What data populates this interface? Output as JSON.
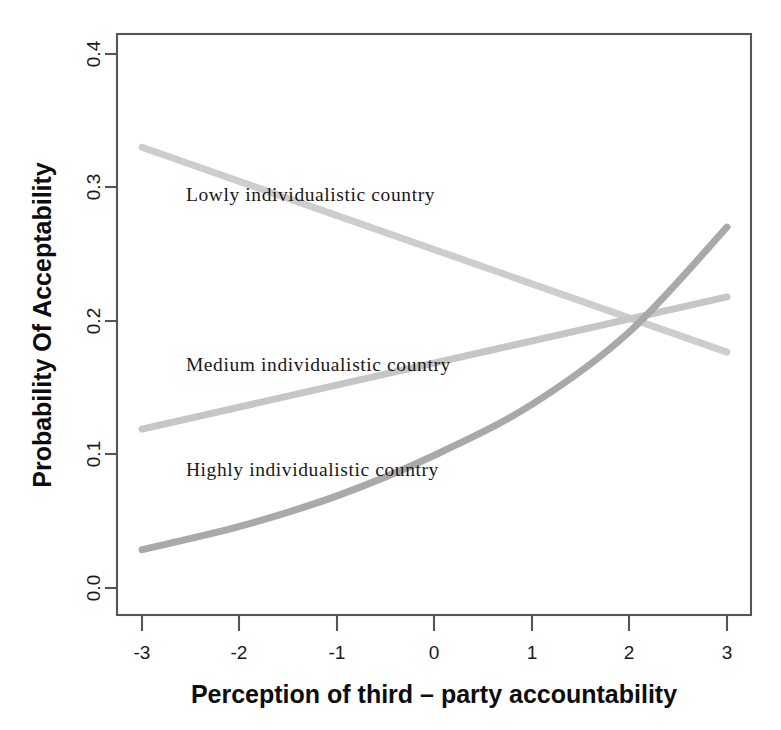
{
  "chart_data": {
    "type": "line",
    "title": "",
    "xlabel": "Perception of third – party accountability",
    "ylabel": "Probability Of Acceptability",
    "xlim": [
      -3,
      3
    ],
    "ylim": [
      0.0,
      0.4
    ],
    "grid": false,
    "legend_position": "inline-annotations",
    "x_ticks": [
      "-3",
      "-2",
      "-1",
      "0",
      "1",
      "2",
      "3"
    ],
    "x_tick_values": [
      -3,
      -2,
      -1,
      0,
      1,
      2,
      3
    ],
    "y_ticks": [
      "0.0",
      "0.1",
      "0.2",
      "0.3",
      "0.4"
    ],
    "y_tick_values": [
      0.0,
      0.1,
      0.2,
      0.3,
      0.4
    ],
    "x": [
      -3,
      -2,
      -1,
      0,
      1,
      2,
      3
    ],
    "series": [
      {
        "name": "Lowly individualistic country",
        "color": "#cdcdcd",
        "shape": "straight",
        "width": 7,
        "values": [
          0.322,
          0.299,
          0.275,
          0.251,
          0.228,
          0.204,
          0.181
        ]
      },
      {
        "name": "Medium individualistic country",
        "color": "#c6c6c6",
        "shape": "straight",
        "width": 7,
        "values": [
          0.128,
          0.143,
          0.158,
          0.173,
          0.189,
          0.204,
          0.219
        ]
      },
      {
        "name": "Highly individualistic country",
        "color": "#a9a9a9",
        "shape": "curved",
        "width": 7,
        "values": [
          0.045,
          0.061,
          0.082,
          0.11,
          0.145,
          0.195,
          0.267
        ]
      }
    ],
    "annotations": [
      {
        "text": "Lowly individualistic country",
        "x": -2.55,
        "y": 0.285
      },
      {
        "text": "Medium individualistic country",
        "x": -2.55,
        "y": 0.168
      },
      {
        "text": "Highly individualistic country",
        "x": -2.55,
        "y": 0.096
      }
    ],
    "crossing_point": {
      "x": 1.9,
      "y": 0.204
    }
  },
  "axes": {
    "y_title": "Probability Of Acceptability",
    "x_title": "Perception of third – party accountability"
  },
  "ticks": {
    "x": [
      "-3",
      "-2",
      "-1",
      "0",
      "1",
      "2",
      "3"
    ],
    "y": [
      "0.0",
      "0.1",
      "0.2",
      "0.3",
      "0.4"
    ]
  },
  "labels": {
    "low": "Lowly individualistic country",
    "medium": "Medium individualistic country",
    "high": "Highly individualistic country"
  },
  "colors": {
    "low_line": "#cdcdcd",
    "medium_line": "#c6c6c6",
    "high_line": "#a9a9a9",
    "frame": "#555555",
    "text": "#0d0d0d",
    "background": "#ffffff"
  }
}
